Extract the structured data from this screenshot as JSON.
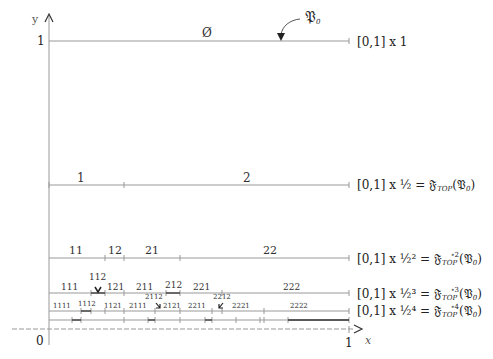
{
  "axes": {
    "y_label": "y",
    "x_label": "x",
    "origin_label": "0",
    "y_one_label": "1",
    "x_one_label": "1"
  },
  "top_row": {
    "segment_label": "Ø",
    "pointer_label": "𝔓",
    "pointer_sub": "0",
    "row_label": "[0,1] x 1"
  },
  "rows": [
    {
      "row_label": "[0,1] x ½ = ",
      "func": "𝔉",
      "func_sub": "TOP",
      "func_sup": "",
      "arg": "(𝔓",
      "arg_sub": "0",
      "arg_close": ")",
      "segments": [
        "1",
        "2"
      ]
    },
    {
      "row_label": "[0,1] x ½² = ",
      "func": "𝔉",
      "func_sub": "TOP",
      "func_sup": "∘2",
      "arg": "(𝔓",
      "arg_sub": "0",
      "arg_close": ")",
      "segments": [
        "11",
        "12",
        "21",
        "22"
      ]
    },
    {
      "row_label": "[0,1] x ½³ = ",
      "func": "𝔉",
      "func_sub": "TOP",
      "func_sup": "∘3",
      "arg": "(𝔓",
      "arg_sub": "0",
      "arg_close": ")",
      "segments": [
        "111",
        "112",
        "121",
        "211",
        "212",
        "221",
        "222"
      ]
    },
    {
      "row_label": "[0,1] x ½⁴ = ",
      "func": "𝔉",
      "func_sub": "TOP",
      "func_sup": "∘4",
      "arg": "(𝔓",
      "arg_sub": "0",
      "arg_close": ")",
      "segments": [
        "1111",
        "1112",
        "1121",
        "2111",
        "2112",
        "2121",
        "2211",
        "2212",
        "2221",
        "2222"
      ]
    }
  ]
}
